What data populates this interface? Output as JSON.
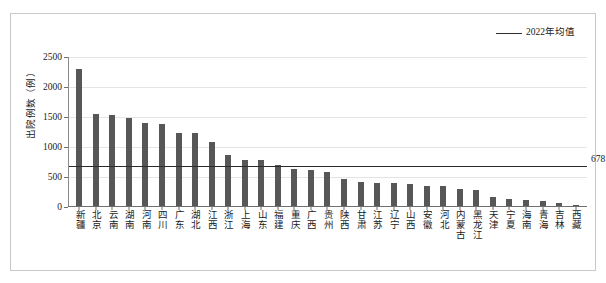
{
  "chart_data": {
    "type": "bar",
    "title": "",
    "xlabel": "",
    "ylabel": "出院例数（例）",
    "ylim": [
      0,
      2500
    ],
    "yticks": [
      0,
      500,
      1000,
      1500,
      2000,
      2500
    ],
    "grid": true,
    "legend_position": "top-right",
    "categories": [
      "新疆",
      "北京",
      "云南",
      "湖南",
      "河南",
      "四川",
      "广东",
      "湖北",
      "江西",
      "浙江",
      "上海",
      "山东",
      "福建",
      "重庆",
      "广西",
      "贵州",
      "陕西",
      "甘肃",
      "江苏",
      "辽宁",
      "山西",
      "安徽",
      "河北",
      "内蒙古",
      "黑龙江",
      "天津",
      "宁夏",
      "海南",
      "青海",
      "吉林",
      "西藏"
    ],
    "values": [
      2300,
      1555,
      1530,
      1480,
      1400,
      1390,
      1240,
      1235,
      1090,
      870,
      790,
      780,
      700,
      640,
      615,
      590,
      460,
      420,
      405,
      395,
      380,
      350,
      345,
      300,
      290,
      170,
      140,
      125,
      95,
      60,
      30
    ],
    "series": [
      {
        "name": "出院例数",
        "values": [
          2300,
          1555,
          1530,
          1480,
          1400,
          1390,
          1240,
          1235,
          1090,
          870,
          790,
          780,
          700,
          640,
          615,
          590,
          460,
          420,
          405,
          395,
          380,
          350,
          345,
          300,
          290,
          170,
          140,
          125,
          95,
          60,
          30
        ],
        "color": "#575757"
      }
    ],
    "reference_line": {
      "label": "2022年均值",
      "value": 678,
      "value_text": "678",
      "color": "#2b2b2b"
    }
  },
  "legend": {
    "entries": [
      {
        "label": "2022年均值",
        "marker": "line",
        "color": "#2b2b2b"
      }
    ]
  },
  "axis": {
    "y_title": "出院例数（例）",
    "y_tick_labels": [
      "2500",
      "2000",
      "1500",
      "1000",
      "500",
      "0"
    ]
  },
  "colors": {
    "bar": "#575857",
    "mean_line": "#2b2b2b",
    "grid": "#e4e4e4",
    "axis": "#6f6f6f",
    "frame": "#c9c9c9",
    "text": "#1a1a1a",
    "background": "#ffffff"
  }
}
